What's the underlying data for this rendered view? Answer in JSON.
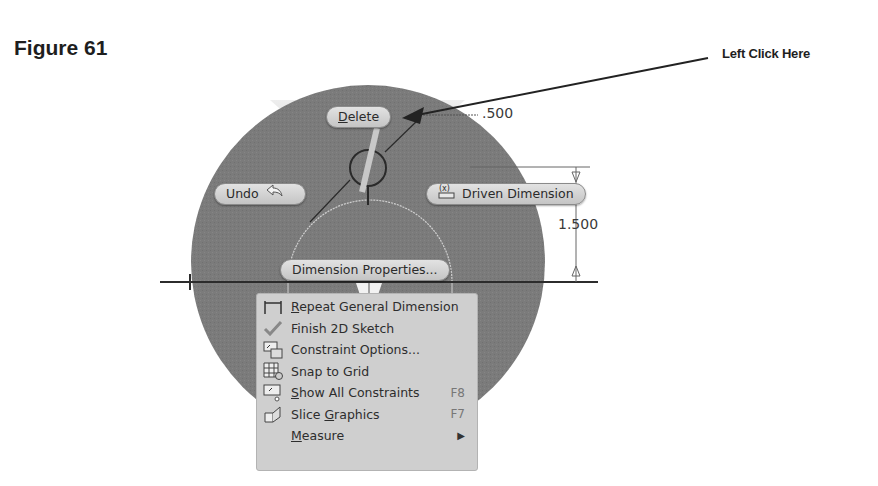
{
  "figure": {
    "title": "Figure 61",
    "callout": "Left Click Here"
  },
  "dimensions": {
    "top_value": ".500",
    "right_value": "1.500"
  },
  "marking_menu": {
    "delete": {
      "label": "Delete",
      "underline": "D",
      "rest": "elete"
    },
    "undo": {
      "label": "Undo",
      "icon": "undo-arrow-icon"
    },
    "driven_dimension": {
      "label": "Driven Dimension",
      "icon": "driven-dimension-icon"
    },
    "dimension_properties": {
      "label": "Dimension Properties..."
    }
  },
  "context_menu": {
    "items": [
      {
        "label": "Repeat General Dimension",
        "u": "R",
        "rest": "epeat General Dimension",
        "icon": "general-dimension-icon",
        "shortcut": ""
      },
      {
        "label": "Finish 2D Sketch",
        "u": "",
        "rest": "Finish 2D Sketch",
        "icon": "checkmark-icon",
        "shortcut": ""
      },
      {
        "label": "Constraint Options...",
        "u": "",
        "rest": "Constraint Options...",
        "icon": "constraint-options-icon",
        "shortcut": ""
      },
      {
        "label": "Snap to Grid",
        "u": "",
        "rest": "Snap to Grid",
        "icon": "snap-grid-icon",
        "shortcut": ""
      },
      {
        "label": "Show All Constraints",
        "u": "S",
        "rest": "how All Constraints",
        "icon": "show-constraints-icon",
        "shortcut": "F8"
      },
      {
        "label": "Slice Graphics",
        "u": "",
        "rest": "Slice ",
        "u2": "G",
        "rest2": "raphics",
        "icon": "slice-graphics-icon",
        "shortcut": "F7"
      },
      {
        "label": "Measure",
        "u": "M",
        "rest": "easure",
        "icon": "",
        "shortcut": "",
        "submenu": "▶"
      }
    ]
  }
}
